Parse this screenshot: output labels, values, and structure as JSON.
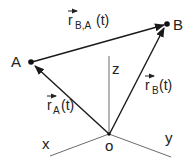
{
  "diagram": {
    "type": "relative-position-vectors",
    "colors": {
      "line": "#1a1a1a",
      "axis": "#6a6a6a",
      "text": "#222222",
      "background": "#ffffff"
    },
    "points": {
      "A": {
        "label": "A",
        "x": 31,
        "y": 62
      },
      "B": {
        "label": "B",
        "x": 167,
        "y": 24
      },
      "O": {
        "label": "o",
        "x": 109,
        "y": 134
      }
    },
    "axes": {
      "x": {
        "label": "x"
      },
      "y": {
        "label": "y"
      },
      "z": {
        "label": "z"
      }
    },
    "vectors": {
      "rBA": {
        "base": "r",
        "subscript": "B,A",
        "arg": "(t)",
        "from": "A",
        "to": "B"
      },
      "rA": {
        "base": "r",
        "subscript": "A",
        "arg": "(t)",
        "from": "O",
        "to": "A"
      },
      "rB": {
        "base": "r",
        "subscript": "B",
        "arg": "(t)",
        "from": "O",
        "to": "B"
      }
    }
  }
}
